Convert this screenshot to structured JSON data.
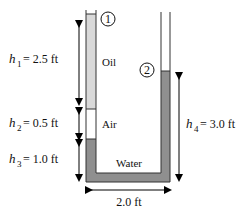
{
  "diagram": {
    "points": [
      {
        "label": "1"
      },
      {
        "label": "2"
      }
    ],
    "fluids": {
      "oil": {
        "label": "Oil",
        "color": "#d9d9d9"
      },
      "air": {
        "label": "Air",
        "color": "#ffffff"
      },
      "water": {
        "label": "Water",
        "color": "#8f8f8f"
      }
    },
    "dimensions": {
      "h1": {
        "symbol": "h",
        "sub": "1",
        "value": "= 2.5 ft"
      },
      "h2": {
        "symbol": "h",
        "sub": "2",
        "value": "= 0.5 ft"
      },
      "h3": {
        "symbol": "h",
        "sub": "3",
        "value": "= 1.0 ft"
      },
      "h4": {
        "symbol": "h",
        "sub": "4",
        "value": "= 3.0 ft"
      },
      "width": {
        "value": "2.0 ft"
      }
    }
  }
}
